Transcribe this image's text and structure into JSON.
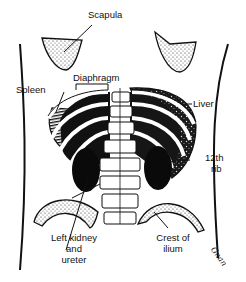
{
  "diagram": {
    "labels": {
      "scapula": "Scapula",
      "diaphragm": "Diaphragm",
      "spleen": "Spleen",
      "liver": "Liver",
      "rib12_line1": "12th",
      "rib12_line2": "rib",
      "kidney_line1": "Left kidney",
      "kidney_line2": "and",
      "kidney_line3": "ureter",
      "crest_line1": "Crest of",
      "crest_line2": "ilium"
    },
    "signature": "Gnan",
    "colors": {
      "ink": "#111111",
      "background": "#ffffff",
      "stipple": "#9a9a9a"
    }
  }
}
